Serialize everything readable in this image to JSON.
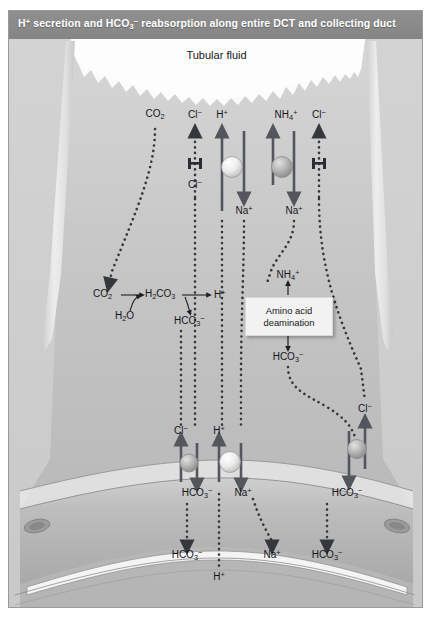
{
  "figure": {
    "title_parts": {
      "a": "H",
      "a_sup": "+",
      "b": " secretion and HCO",
      "b_sub": "3",
      "b_sup": "−",
      "c": " reabsorption along entire DCT and collecting duct"
    },
    "lumen_label": "Tubular fluid",
    "callout_box": {
      "line1": "Amino acid",
      "line2": "deamination"
    }
  },
  "colors": {
    "titlebar": "#8a8a8a",
    "title_text": "#ffffff",
    "background": "#cfcfcf",
    "cell_body": "#c6c6c6",
    "lumen_fluid": "#fbfbfb",
    "membrane": "#e3e3e3",
    "arrow_solid": "#53565c",
    "arrow_dotted": "#3a3d42",
    "pump_fill": "#e8e8e8",
    "label_text": "#15161a",
    "box_fill": "#f2f2f2"
  },
  "apical_labels": [
    {
      "id": "co2",
      "text": "CO",
      "sub": "2",
      "sup": "",
      "x": 146,
      "y": 78
    },
    {
      "id": "cl-1",
      "text": "Cl",
      "sub": "",
      "sup": "−",
      "x": 186,
      "y": 78
    },
    {
      "id": "h-1",
      "text": "H",
      "sub": "",
      "sup": "+",
      "x": 214,
      "y": 78
    },
    {
      "id": "nh4",
      "text": "NH",
      "sub": "4",
      "sup": "+",
      "x": 277,
      "y": 78
    },
    {
      "id": "cl-2",
      "text": "Cl",
      "sub": "",
      "sup": "−",
      "x": 310,
      "y": 78
    }
  ],
  "apical_inner_labels": [
    {
      "id": "cl-in",
      "text": "Cl",
      "sub": "",
      "sup": "−",
      "x": 186,
      "y": 146
    },
    {
      "id": "na-1",
      "text": "Na",
      "sub": "",
      "sup": "+",
      "x": 235,
      "y": 172
    },
    {
      "id": "na-2",
      "text": "Na",
      "sub": "",
      "sup": "+",
      "x": 264,
      "y": 172
    }
  ],
  "reaction": {
    "co2": {
      "text": "CO",
      "sub": "2",
      "sup": "",
      "x": 95,
      "y": 259
    },
    "h2o": {
      "text": "H",
      "sub": "2",
      "sup": "",
      "tail": "O",
      "x": 114,
      "y": 276
    },
    "h2co3": {
      "text": "H",
      "sub": "2",
      "tail": "CO",
      "sub2": "3",
      "x": 140,
      "y": 259
    },
    "hco3": {
      "text": "HCO",
      "sub": "3",
      "sup": "−",
      "x": 172,
      "y": 280
    },
    "hplus": {
      "text": "H",
      "sub": "",
      "sup": "+",
      "x": 208,
      "y": 259
    }
  },
  "mid_labels": [
    {
      "id": "nh4-mid",
      "text": "NH",
      "sub": "4",
      "sup": "+",
      "x": 279,
      "y": 236
    },
    {
      "id": "hco3-mid",
      "text": "HCO",
      "sub": "3",
      "sup": "−",
      "x": 279,
      "y": 318
    },
    {
      "id": "cl-right",
      "text": "Cl",
      "sub": "",
      "sup": "−",
      "x": 356,
      "y": 371
    }
  ],
  "basolateral_labels": [
    {
      "id": "cl-bl",
      "text": "Cl",
      "sub": "",
      "sup": "−",
      "x": 172,
      "y": 393
    },
    {
      "id": "h-bl",
      "text": "H",
      "sub": "",
      "sup": "+",
      "x": 210,
      "y": 393
    },
    {
      "id": "hco3-bl-1",
      "text": "HCO",
      "sub": "3",
      "sup": "−",
      "x": 172,
      "y": 453
    },
    {
      "id": "na-bl",
      "text": "Na",
      "sub": "",
      "sup": "+",
      "x": 235,
      "y": 453
    },
    {
      "id": "hco3-bl-2",
      "text": "HCO",
      "sub": "3",
      "sup": "−",
      "x": 336,
      "y": 453
    }
  ],
  "interstitium_labels": [
    {
      "id": "hco3-bot-1",
      "text": "HCO",
      "sub": "3",
      "sup": "−",
      "x": 178,
      "y": 516
    },
    {
      "id": "h-bot",
      "text": "H",
      "sub": "",
      "sup": "+",
      "x": 210,
      "y": 538
    },
    {
      "id": "na-bot",
      "text": "Na",
      "sub": "",
      "sup": "+",
      "x": 263,
      "y": 516
    },
    {
      "id": "hco3-bot-2",
      "text": "HCO",
      "sub": "3",
      "sup": "−",
      "x": 318,
      "y": 516
    }
  ],
  "transporters": [
    {
      "id": "apical-cl-channel",
      "kind": "channel",
      "x": 186,
      "y": 121
    },
    {
      "id": "apical-h-pump",
      "kind": "pump",
      "x": 223,
      "y": 128
    },
    {
      "id": "apical-nh4-pump",
      "kind": "pump",
      "x": 273,
      "y": 128
    },
    {
      "id": "apical-cl-channel-2",
      "kind": "channel",
      "x": 310,
      "y": 121
    },
    {
      "id": "basolateral-cl-hco3-exchanger-left",
      "kind": "pump",
      "x": 180,
      "y": 424
    },
    {
      "id": "basolateral-h-na-pump",
      "kind": "pump",
      "x": 218,
      "y": 424
    },
    {
      "id": "basolateral-cl-hco3-exchanger-right",
      "kind": "pump",
      "x": 350,
      "y": 410
    }
  ]
}
